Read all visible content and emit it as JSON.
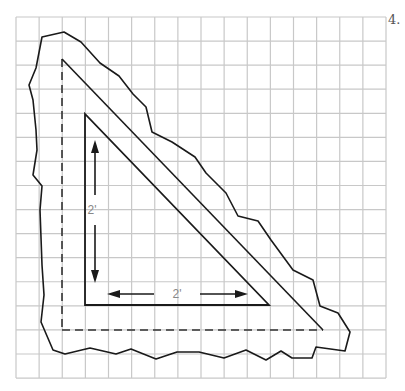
{
  "problem_number": "4.",
  "grid": {
    "x0": 16,
    "y0": 17,
    "cols": 16,
    "rows": 15,
    "cell_w": 23.125,
    "cell_h": 24.07,
    "color": "#c8c8c8"
  },
  "labels": {
    "vertical_dimension": "2'",
    "horizontal_dimension": "2'"
  },
  "colors": {
    "line": "#1a1a1a",
    "label": "#888888"
  },
  "shapes": {
    "inner_triangle": [
      [
        85,
        114
      ],
      [
        85,
        305
      ],
      [
        269,
        305
      ]
    ],
    "middle_triangle_diagonal": [
      [
        62,
        59
      ],
      [
        323,
        330
      ]
    ],
    "dashed_edges": [
      [
        [
          62,
          59
        ],
        [
          62,
          330
        ]
      ],
      [
        [
          62,
          330
        ],
        [
          323,
          330
        ]
      ]
    ],
    "outline": [
      [
        42,
        37
      ],
      [
        64,
        32
      ],
      [
        81,
        42
      ],
      [
        100,
        63
      ],
      [
        119,
        76
      ],
      [
        133,
        94
      ],
      [
        146,
        107
      ],
      [
        152,
        132
      ],
      [
        172,
        142
      ],
      [
        195,
        157
      ],
      [
        206,
        173
      ],
      [
        226,
        193
      ],
      [
        238,
        216
      ],
      [
        258,
        221
      ],
      [
        271,
        240
      ],
      [
        293,
        270
      ],
      [
        313,
        280
      ],
      [
        320,
        306
      ],
      [
        338,
        313
      ],
      [
        350,
        332
      ],
      [
        345,
        351
      ],
      [
        316,
        347
      ],
      [
        312,
        358
      ],
      [
        292,
        358
      ],
      [
        281,
        351
      ],
      [
        266,
        360
      ],
      [
        246,
        350
      ],
      [
        224,
        358
      ],
      [
        199,
        352
      ],
      [
        177,
        352
      ],
      [
        156,
        359
      ],
      [
        131,
        349
      ],
      [
        116,
        354
      ],
      [
        90,
        348
      ],
      [
        65,
        354
      ],
      [
        53,
        350
      ],
      [
        41,
        322
      ],
      [
        44,
        295
      ],
      [
        42,
        265
      ],
      [
        40,
        210
      ],
      [
        42,
        186
      ],
      [
        33,
        175
      ],
      [
        37,
        150
      ],
      [
        36,
        130
      ],
      [
        33,
        100
      ],
      [
        29,
        85
      ],
      [
        36,
        68
      ]
    ]
  },
  "arrows": {
    "vertical": {
      "x": 95,
      "y1": 140,
      "y2": 283,
      "gap": [
        195,
        225
      ],
      "label_pos": [
        92,
        214
      ]
    },
    "horizontal": {
      "y": 294,
      "x1": 107,
      "x2": 248,
      "gap": [
        154,
        200
      ],
      "label_pos": [
        177,
        298
      ]
    }
  }
}
